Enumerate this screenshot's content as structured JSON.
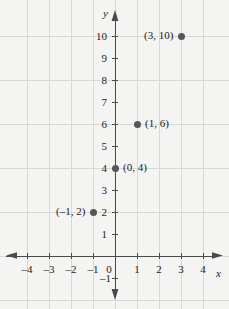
{
  "chart_data": {
    "type": "scatter",
    "title": "",
    "subtitle": "",
    "xlabel": "x",
    "ylabel": "y",
    "xlim": [
      -4.8,
      4.8
    ],
    "ylim": [
      -1.6,
      10.8
    ],
    "grid": true,
    "legend": null,
    "x_ticks": [
      -4,
      -3,
      -2,
      -1,
      0,
      1,
      2,
      3,
      4
    ],
    "x_tick_labels": [
      "–4",
      "–3",
      "–2",
      "–1",
      "0",
      "1",
      "2",
      "3",
      "4"
    ],
    "y_ticks": [
      -1,
      1,
      2,
      3,
      4,
      5,
      6,
      7,
      8,
      9,
      10
    ],
    "y_tick_labels": [
      "–1",
      "1",
      "2",
      "3",
      "4",
      "5",
      "6",
      "7",
      "8",
      "9",
      "10"
    ],
    "points": [
      {
        "x": -1,
        "y": 2,
        "label": "(–1, 2)",
        "label_side": "left"
      },
      {
        "x": 0,
        "y": 4,
        "label": "(0, 4)",
        "label_side": "right"
      },
      {
        "x": 1,
        "y": 6,
        "label": "(1, 6)",
        "label_side": "right"
      },
      {
        "x": 3,
        "y": 10,
        "label": "(3, 10)",
        "label_side": "left"
      }
    ],
    "point_color": "#565656",
    "axis_color": "#4a4a4a",
    "grid_color": "#d8d8d6",
    "background_color": "#f4f4f2",
    "gridlines_vertical_step": 1,
    "gridlines_horizontal_step": 2
  },
  "axis_labels": {
    "x": "x",
    "y": "y"
  },
  "icons": {
    "x_axis_arrow_right": "arrow-right-icon",
    "x_axis_arrow_left": "arrow-left-icon",
    "y_axis_arrow_up": "arrow-up-icon",
    "y_axis_arrow_down": "arrow-down-icon"
  }
}
